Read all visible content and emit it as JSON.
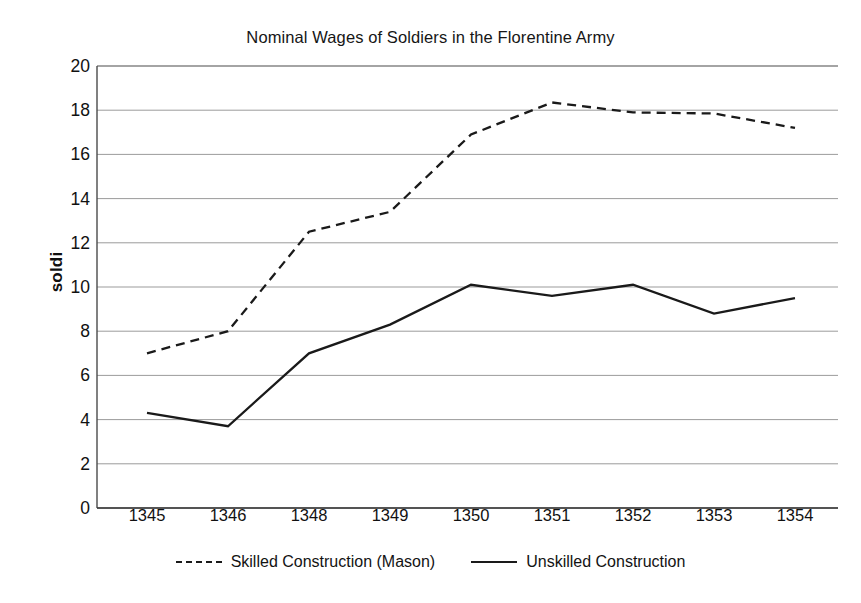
{
  "chart_data": {
    "type": "line",
    "title": "Nominal Wages of Soldiers in the Florentine Army",
    "xlabel": "",
    "ylabel": "soldi",
    "categories": [
      "1345",
      "1346",
      "1348",
      "1349",
      "1350",
      "1351",
      "1352",
      "1353",
      "1354"
    ],
    "ylim": [
      0,
      20
    ],
    "ytick_step": 2,
    "yticks": [
      "20",
      "18",
      "16",
      "14",
      "12",
      "10",
      "8",
      "6",
      "4",
      "2",
      "0"
    ],
    "grid": true,
    "legend_position": "bottom",
    "series": [
      {
        "name": "Skilled Construction (Mason)",
        "style": "dashed",
        "color": "#1a1a1a",
        "values": [
          7.0,
          8.0,
          12.5,
          13.4,
          16.9,
          18.35,
          17.9,
          17.85,
          17.2
        ]
      },
      {
        "name": "Unskilled Construction",
        "style": "solid",
        "color": "#1a1a1a",
        "values": [
          4.3,
          3.7,
          7.0,
          8.3,
          10.1,
          9.6,
          10.1,
          8.8,
          9.5
        ]
      }
    ]
  },
  "axis": {
    "y_label_text": "soldi"
  }
}
